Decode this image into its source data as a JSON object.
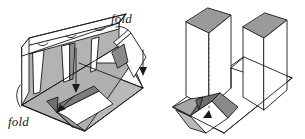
{
  "figure": {
    "background_color": "#ffffff",
    "stroke_color": "#1a1a1a",
    "fill_light": "#ffffff",
    "fill_mid": "#b9b9b9",
    "fill_dark": "#8f8f8f",
    "fill_darker": "#6f6f6f",
    "labels": {
      "fold_left": "fold",
      "fold_right": "fold"
    },
    "annotations": {
      "dashed_line_name": "fold-crease-dashed",
      "arrow_count": 3
    },
    "panels": {
      "left_figure_name": "left-folded-structure",
      "right_figure_name": "right-folded-structure"
    }
  }
}
